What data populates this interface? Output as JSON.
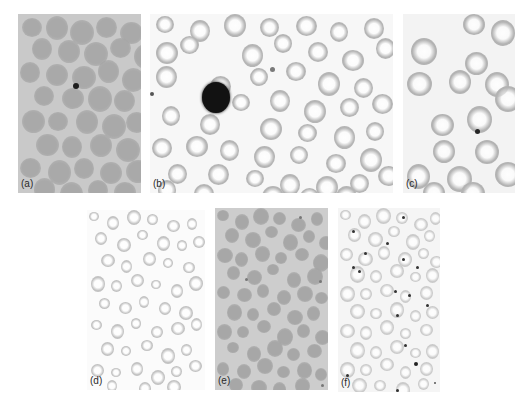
{
  "figure": {
    "panels": [
      {
        "id": "a",
        "label": "(a)",
        "x": 18,
        "y": 14,
        "w": 123,
        "h": 179,
        "background": "#c9c9c9",
        "style": "filled",
        "cell_color": "#a9a9a9",
        "cell_size": 22,
        "cells": [
          [
            4,
            4
          ],
          [
            28,
            2
          ],
          [
            52,
            6
          ],
          [
            78,
            3
          ],
          [
            102,
            8
          ],
          [
            14,
            24
          ],
          [
            40,
            26
          ],
          [
            66,
            28
          ],
          [
            92,
            24
          ],
          [
            116,
            30
          ],
          [
            2,
            48
          ],
          [
            28,
            50
          ],
          [
            54,
            52
          ],
          [
            80,
            46
          ],
          [
            104,
            54
          ],
          [
            16,
            72
          ],
          [
            44,
            74
          ],
          [
            70,
            72
          ],
          [
            96,
            76
          ],
          [
            4,
            96
          ],
          [
            30,
            98
          ],
          [
            58,
            96
          ],
          [
            84,
            100
          ],
          [
            108,
            98
          ],
          [
            18,
            120
          ],
          [
            44,
            122
          ],
          [
            72,
            120
          ],
          [
            98,
            124
          ],
          [
            2,
            144
          ],
          [
            30,
            146
          ],
          [
            56,
            144
          ],
          [
            82,
            148
          ],
          [
            108,
            146
          ],
          [
            16,
            164
          ],
          [
            42,
            168
          ],
          [
            70,
            166
          ],
          [
            96,
            168
          ]
        ],
        "dots": [
          [
            55,
            69,
            6,
            "#1e1e1e"
          ]
        ]
      },
      {
        "id": "b",
        "label": "(b)",
        "x": 150,
        "y": 14,
        "w": 243,
        "h": 179,
        "background": "#f7f7f7",
        "style": "ring",
        "cell_color": "#b5b5b5",
        "cell_size": 20,
        "cells": [
          [
            6,
            2
          ],
          [
            40,
            6
          ],
          [
            74,
            0
          ],
          [
            110,
            4
          ],
          [
            146,
            2
          ],
          [
            180,
            8
          ],
          [
            214,
            4
          ],
          [
            6,
            28
          ],
          [
            30,
            22
          ],
          [
            92,
            30
          ],
          [
            124,
            20
          ],
          [
            158,
            28
          ],
          [
            192,
            36
          ],
          [
            226,
            24
          ],
          [
            6,
            52
          ],
          [
            100,
            54
          ],
          [
            136,
            48
          ],
          [
            168,
            58
          ],
          [
            204,
            64
          ],
          [
            60,
            62
          ],
          [
            82,
            80
          ],
          [
            120,
            76
          ],
          [
            154,
            86
          ],
          [
            190,
            84
          ],
          [
            222,
            80
          ],
          [
            12,
            92
          ],
          [
            50,
            100
          ],
          [
            110,
            104
          ],
          [
            148,
            110
          ],
          [
            184,
            112
          ],
          [
            216,
            108
          ],
          [
            2,
            124
          ],
          [
            36,
            122
          ],
          [
            70,
            126
          ],
          [
            104,
            132
          ],
          [
            140,
            132
          ],
          [
            176,
            140
          ],
          [
            210,
            134
          ],
          [
            18,
            150
          ],
          [
            58,
            150
          ],
          [
            96,
            156
          ],
          [
            130,
            160
          ],
          [
            166,
            162
          ],
          [
            200,
            160
          ],
          [
            228,
            152
          ],
          [
            8,
            166
          ],
          [
            44,
            170
          ],
          [
            112,
            172
          ],
          [
            150,
            174
          ],
          [
            186,
            172
          ]
        ],
        "dots": [
          [
            52,
            68,
            28,
            "#121212"
          ],
          [
            120,
            53,
            5,
            "#7a7a7a"
          ],
          [
            0,
            78,
            4,
            "#555555"
          ]
        ]
      },
      {
        "id": "c",
        "label": "(c)",
        "x": 403,
        "y": 14,
        "w": 112,
        "h": 179,
        "background": "#f3f3f3",
        "style": "ring",
        "cell_color": "#b3b3b3",
        "cell_size": 24,
        "cells": [
          [
            60,
            0
          ],
          [
            88,
            6
          ],
          [
            8,
            24
          ],
          [
            62,
            38
          ],
          [
            4,
            58
          ],
          [
            46,
            56
          ],
          [
            82,
            58
          ],
          [
            92,
            72
          ],
          [
            28,
            100
          ],
          [
            64,
            92
          ],
          [
            30,
            126
          ],
          [
            72,
            126
          ],
          [
            92,
            148
          ],
          [
            4,
            150
          ],
          [
            44,
            152
          ],
          [
            20,
            168
          ],
          [
            58,
            168
          ]
        ],
        "dots": [
          [
            72,
            115,
            5,
            "#262626"
          ]
        ]
      },
      {
        "id": "d",
        "label": "(d)",
        "x": 87,
        "y": 210,
        "w": 118,
        "h": 180,
        "background": "#fbfbfb",
        "style": "ring",
        "cell_color": "#c2c2c2",
        "cell_size": 12,
        "cells": [
          [
            2,
            2
          ],
          [
            20,
            6
          ],
          [
            40,
            0
          ],
          [
            60,
            4
          ],
          [
            80,
            10
          ],
          [
            100,
            8
          ],
          [
            8,
            22
          ],
          [
            30,
            28
          ],
          [
            50,
            20
          ],
          [
            70,
            26
          ],
          [
            90,
            30
          ],
          [
            106,
            26
          ],
          [
            14,
            44
          ],
          [
            34,
            50
          ],
          [
            56,
            42
          ],
          [
            76,
            48
          ],
          [
            96,
            52
          ],
          [
            4,
            66
          ],
          [
            24,
            70
          ],
          [
            44,
            64
          ],
          [
            64,
            70
          ],
          [
            84,
            74
          ],
          [
            102,
            66
          ],
          [
            12,
            88
          ],
          [
            32,
            92
          ],
          [
            52,
            86
          ],
          [
            72,
            92
          ],
          [
            92,
            96
          ],
          [
            4,
            110
          ],
          [
            24,
            114
          ],
          [
            44,
            108
          ],
          [
            64,
            116
          ],
          [
            84,
            112
          ],
          [
            104,
            108
          ],
          [
            14,
            132
          ],
          [
            34,
            136
          ],
          [
            54,
            130
          ],
          [
            74,
            138
          ],
          [
            94,
            134
          ],
          [
            4,
            154
          ],
          [
            24,
            158
          ],
          [
            44,
            152
          ],
          [
            64,
            160
          ],
          [
            84,
            156
          ],
          [
            102,
            150
          ],
          [
            20,
            170
          ],
          [
            52,
            172
          ],
          [
            80,
            170
          ]
        ],
        "dots": []
      },
      {
        "id": "e",
        "label": "(e)",
        "x": 215,
        "y": 208,
        "w": 113,
        "h": 182,
        "background": "#cdcdcd",
        "style": "filled",
        "cell_color": "#a7a7a7",
        "cell_size": 14,
        "cells": [
          [
            2,
            2
          ],
          [
            20,
            6
          ],
          [
            38,
            0
          ],
          [
            58,
            4
          ],
          [
            76,
            10
          ],
          [
            96,
            4
          ],
          [
            10,
            20
          ],
          [
            30,
            24
          ],
          [
            50,
            18
          ],
          [
            68,
            26
          ],
          [
            88,
            22
          ],
          [
            104,
            28
          ],
          [
            2,
            40
          ],
          [
            20,
            44
          ],
          [
            40,
            38
          ],
          [
            60,
            44
          ],
          [
            80,
            40
          ],
          [
            98,
            46
          ],
          [
            12,
            58
          ],
          [
            32,
            62
          ],
          [
            52,
            56
          ],
          [
            72,
            64
          ],
          [
            92,
            60
          ],
          [
            2,
            78
          ],
          [
            22,
            80
          ],
          [
            42,
            76
          ],
          [
            62,
            82
          ],
          [
            82,
            78
          ],
          [
            100,
            84
          ],
          [
            12,
            96
          ],
          [
            32,
            100
          ],
          [
            52,
            94
          ],
          [
            72,
            102
          ],
          [
            92,
            98
          ],
          [
            2,
            116
          ],
          [
            22,
            118
          ],
          [
            42,
            112
          ],
          [
            62,
            120
          ],
          [
            82,
            116
          ],
          [
            100,
            122
          ],
          [
            12,
            134
          ],
          [
            32,
            138
          ],
          [
            52,
            132
          ],
          [
            72,
            140
          ],
          [
            92,
            136
          ],
          [
            2,
            154
          ],
          [
            22,
            156
          ],
          [
            42,
            150
          ],
          [
            62,
            158
          ],
          [
            82,
            154
          ],
          [
            100,
            160
          ],
          [
            14,
            170
          ],
          [
            36,
            172
          ],
          [
            58,
            174
          ],
          [
            80,
            170
          ]
        ],
        "dots": [
          [
            30,
            70,
            3,
            "#777777"
          ],
          [
            104,
            72,
            3,
            "#777777"
          ],
          [
            106,
            176,
            3,
            "#777777"
          ],
          [
            84,
            8,
            3,
            "#777777"
          ]
        ]
      },
      {
        "id": "f",
        "label": "(f)",
        "x": 338,
        "y": 208,
        "w": 102,
        "h": 184,
        "background": "#f5f5f5",
        "style": "ring",
        "cell_color": "#cacaca",
        "cell_size": 13,
        "cells": [
          [
            2,
            2
          ],
          [
            20,
            6
          ],
          [
            38,
            0
          ],
          [
            58,
            4
          ],
          [
            76,
            10
          ],
          [
            92,
            4
          ],
          [
            10,
            20
          ],
          [
            30,
            24
          ],
          [
            50,
            18
          ],
          [
            68,
            26
          ],
          [
            86,
            22
          ],
          [
            2,
            40
          ],
          [
            20,
            44
          ],
          [
            40,
            38
          ],
          [
            60,
            44
          ],
          [
            80,
            40
          ],
          [
            92,
            48
          ],
          [
            12,
            58
          ],
          [
            32,
            62
          ],
          [
            52,
            56
          ],
          [
            72,
            64
          ],
          [
            88,
            60
          ],
          [
            2,
            78
          ],
          [
            22,
            80
          ],
          [
            42,
            76
          ],
          [
            62,
            82
          ],
          [
            82,
            78
          ],
          [
            12,
            96
          ],
          [
            32,
            100
          ],
          [
            52,
            94
          ],
          [
            72,
            102
          ],
          [
            88,
            98
          ],
          [
            2,
            116
          ],
          [
            22,
            118
          ],
          [
            42,
            112
          ],
          [
            62,
            120
          ],
          [
            82,
            116
          ],
          [
            12,
            134
          ],
          [
            32,
            138
          ],
          [
            52,
            132
          ],
          [
            72,
            140
          ],
          [
            88,
            136
          ],
          [
            2,
            154
          ],
          [
            22,
            156
          ],
          [
            42,
            150
          ],
          [
            62,
            158
          ],
          [
            82,
            154
          ],
          [
            14,
            170
          ],
          [
            36,
            172
          ],
          [
            58,
            174
          ],
          [
            80,
            170
          ]
        ],
        "dots": [
          [
            64,
            8,
            3,
            "#333333"
          ],
          [
            14,
            22,
            3,
            "#333333"
          ],
          [
            48,
            34,
            3,
            "#333333"
          ],
          [
            26,
            44,
            3,
            "#333333"
          ],
          [
            64,
            50,
            3,
            "#333333"
          ],
          [
            14,
            58,
            3,
            "#333333"
          ],
          [
            20,
            62,
            3,
            "#333333"
          ],
          [
            78,
            58,
            3,
            "#333333"
          ],
          [
            56,
            82,
            3,
            "#333333"
          ],
          [
            70,
            86,
            3,
            "#333333"
          ],
          [
            88,
            96,
            3,
            "#333333"
          ],
          [
            58,
            106,
            3,
            "#333333"
          ],
          [
            66,
            136,
            3,
            "#333333"
          ],
          [
            76,
            154,
            4,
            "#222222"
          ],
          [
            8,
            166,
            3,
            "#333333"
          ],
          [
            58,
            181,
            3,
            "#333333"
          ],
          [
            96,
            174,
            2,
            "#555555"
          ]
        ]
      }
    ]
  }
}
